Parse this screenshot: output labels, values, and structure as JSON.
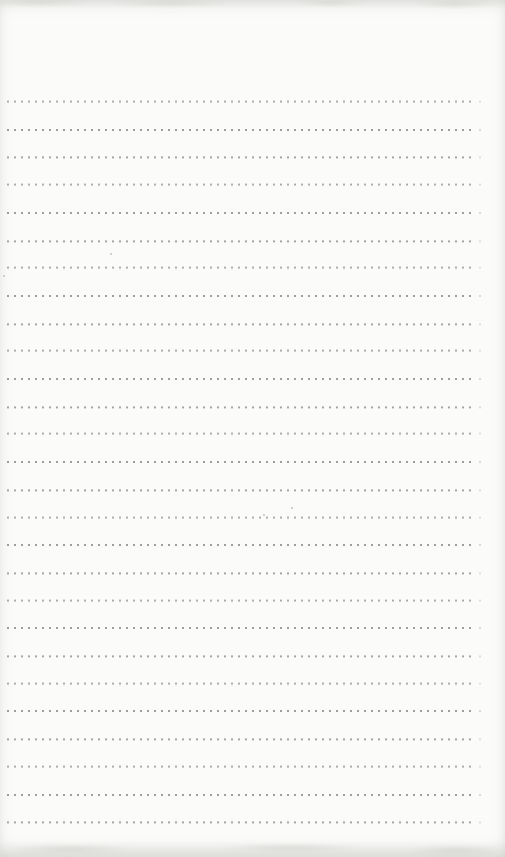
{
  "page": {
    "kind": "blank dotted-rule notebook page (scan)",
    "width": 505,
    "height": 857,
    "background_color": "#fbfbfa"
  },
  "ruling": {
    "line_count": 27,
    "first_line_y": 102,
    "line_spacing": 27.7,
    "dot_start_x": 7,
    "dot_end_x": 473,
    "dot_size": 2,
    "dot_pitch": 7,
    "dot_color": "#8f8f8d"
  },
  "artifacts": {
    "top_smudges": [
      {
        "x": 40,
        "y": 2,
        "w": 90,
        "h": 8
      },
      {
        "x": 170,
        "y": 3,
        "w": 120,
        "h": 8
      },
      {
        "x": 330,
        "y": 2,
        "w": 70,
        "h": 7
      },
      {
        "x": 455,
        "y": 3,
        "w": 80,
        "h": 9
      }
    ],
    "bottom_smudges": [
      {
        "x": 70,
        "y": 849,
        "w": 120,
        "h": 10
      },
      {
        "x": 290,
        "y": 848,
        "w": 140,
        "h": 10
      },
      {
        "x": 455,
        "y": 850,
        "w": 90,
        "h": 11
      }
    ],
    "specks": [
      {
        "x": 291,
        "y": 507
      },
      {
        "x": 263,
        "y": 514
      },
      {
        "x": 110,
        "y": 253
      },
      {
        "x": 3,
        "y": 275
      }
    ]
  }
}
